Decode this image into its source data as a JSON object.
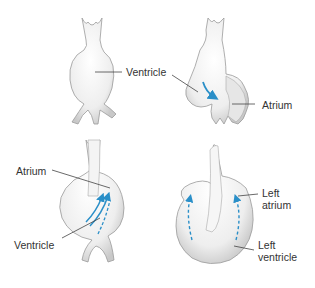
{
  "diagram": {
    "type": "embryonic heart development stages",
    "panels": [
      {
        "id": "panel-1",
        "position": "top-left",
        "labels": [
          {
            "text": "Ventricle"
          }
        ]
      },
      {
        "id": "panel-2",
        "position": "top-right",
        "labels": [
          {
            "text": "Atrium"
          }
        ],
        "arrows": [
          "solid curved blood-flow arrow"
        ]
      },
      {
        "id": "panel-3",
        "position": "bottom-left",
        "labels": [
          {
            "text": "Atrium"
          },
          {
            "text": "Ventricle"
          }
        ],
        "arrows": [
          "solid blood-flow arrows",
          "dashed blood-flow arrow"
        ]
      },
      {
        "id": "panel-4",
        "position": "bottom-right",
        "labels": [
          {
            "line1": "Left",
            "line2": "atrium"
          },
          {
            "line1": "Left",
            "line2": "ventricle"
          }
        ],
        "arrows": [
          "dashed curved arrow left",
          "dashed curved arrow right"
        ]
      }
    ],
    "colors": {
      "arrow": "#2a8fc8",
      "outline": "#8a8a8a",
      "label_line": "#444444",
      "text": "#333333",
      "fill": "#f3f3f3"
    }
  }
}
